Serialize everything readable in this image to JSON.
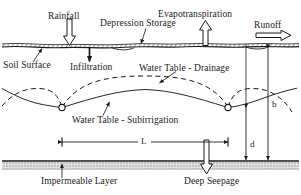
{
  "figure": {
    "type": "hydrology-cross-section-diagram",
    "background_color": "#ffffff",
    "line_color": "#1a1a1a"
  },
  "labels": {
    "rainfall": "Rainfall",
    "depression_storage": "Depression Storage",
    "evapotranspiration": "Evapotranspiration",
    "runoff": "Runoff",
    "soil_surface": "Soil Surface",
    "infiltration": "Infiltration",
    "water_table_drainage": "Water Table - Drainage",
    "water_table_subirrigation": "Water Table - Subirrigation",
    "impermeable_layer": "Impermeable Layer",
    "deep_seepage": "Deep Seepage",
    "dim_b": "b",
    "dim_d": "d",
    "dim_L": "L"
  },
  "annotations": {
    "arrows": [
      {
        "name": "rainfall-arrow",
        "direction": "down"
      },
      {
        "name": "infiltration-arrow",
        "direction": "down"
      },
      {
        "name": "evapotranspiration-arrow",
        "direction": "up"
      },
      {
        "name": "runoff-arrow",
        "direction": "right"
      },
      {
        "name": "deep-seepage-arrow",
        "direction": "down"
      }
    ],
    "leaders": [
      {
        "name": "depression-storage-leader"
      },
      {
        "name": "soil-surface-leader"
      },
      {
        "name": "water-table-drainage-leader"
      },
      {
        "name": "water-table-subirrigation-leader"
      },
      {
        "name": "impermeable-layer-leader"
      }
    ],
    "dimensions": [
      {
        "name": "dimension-b",
        "label": "b",
        "orientation": "vertical",
        "meaning": "depth from soil surface to impermeable layer"
      },
      {
        "name": "dimension-d",
        "label": "d",
        "orientation": "vertical",
        "meaning": "depth from drain to impermeable layer"
      },
      {
        "name": "dimension-L",
        "label": "L",
        "orientation": "horizontal",
        "meaning": "drain spacing"
      }
    ],
    "drains": [
      {
        "name": "drain-left",
        "shape": "circle"
      },
      {
        "name": "drain-right",
        "shape": "circle"
      }
    ],
    "curves": [
      {
        "name": "water-table-drainage-curve",
        "style": "dashed",
        "shape": "arched-up-between-drains"
      },
      {
        "name": "water-table-subirrigation-curve",
        "style": "solid",
        "shape": "dips-down-to-drains"
      }
    ]
  }
}
